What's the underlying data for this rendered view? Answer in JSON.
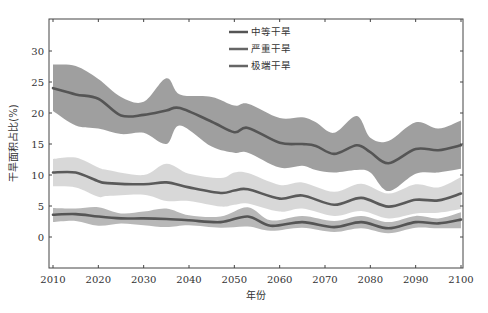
{
  "chart_data": {
    "type": "line",
    "title": "",
    "xlabel": "年份",
    "ylabel": "干旱面积占比(%)",
    "xlim": [
      2010,
      2100
    ],
    "ylim": [
      -5,
      35
    ],
    "x_ticks": [
      2010,
      2020,
      2030,
      2040,
      2050,
      2060,
      2070,
      2080,
      2090,
      2100
    ],
    "y_ticks": [
      0,
      5,
      10,
      15,
      20,
      25,
      30
    ],
    "grid": false,
    "legend_position": "upper center",
    "series": [
      {
        "name": "中等干旱",
        "line_color": "#555555",
        "band_color": "#9a9a9a",
        "x": [
          2010,
          2015,
          2020,
          2025,
          2030,
          2035,
          2038,
          2045,
          2050,
          2053,
          2060,
          2065,
          2068,
          2072,
          2077,
          2080,
          2084,
          2090,
          2095,
          2100
        ],
        "mean": [
          24.0,
          23.0,
          22.3,
          19.6,
          19.7,
          20.4,
          20.8,
          18.6,
          16.9,
          17.6,
          15.2,
          15.0,
          14.7,
          13.4,
          14.8,
          13.7,
          11.9,
          14.2,
          14.0,
          14.8
        ],
        "upper": [
          27.8,
          27.6,
          25.5,
          22.6,
          21.8,
          25.6,
          23.0,
          22.6,
          21.2,
          21.5,
          19.2,
          19.3,
          18.5,
          16.8,
          19.5,
          16.0,
          15.5,
          18.5,
          17.5,
          18.8
        ],
        "lower": [
          20.3,
          18.0,
          17.5,
          16.6,
          16.8,
          15.0,
          18.0,
          14.6,
          13.6,
          13.6,
          11.2,
          11.5,
          10.8,
          10.4,
          10.8,
          10.4,
          7.4,
          10.2,
          10.4,
          11.0
        ]
      },
      {
        "name": "严重干旱",
        "line_color": "#5a5a5a",
        "band_color": "#d6d6d6",
        "x": [
          2010,
          2015,
          2020,
          2022,
          2030,
          2035,
          2040,
          2047,
          2050,
          2053,
          2060,
          2065,
          2072,
          2078,
          2084,
          2090,
          2095,
          2100
        ],
        "mean": [
          10.4,
          10.4,
          9.0,
          8.7,
          8.5,
          8.8,
          8.0,
          7.1,
          7.5,
          7.7,
          6.2,
          6.7,
          5.2,
          6.3,
          4.9,
          6.0,
          5.9,
          7.0
        ],
        "upper": [
          12.6,
          12.8,
          11.2,
          10.8,
          10.0,
          11.8,
          10.2,
          9.5,
          10.4,
          10.3,
          8.4,
          8.8,
          7.3,
          8.6,
          7.0,
          8.5,
          8.0,
          9.7
        ],
        "lower": [
          8.2,
          8.0,
          6.5,
          6.6,
          6.8,
          5.8,
          5.8,
          4.9,
          5.2,
          5.4,
          4.1,
          4.6,
          3.4,
          4.2,
          3.0,
          3.8,
          3.9,
          4.5
        ]
      },
      {
        "name": "极端干旱",
        "line_color": "#555555",
        "band_color": "#b4b4b4",
        "x": [
          2010,
          2015,
          2020,
          2025,
          2030,
          2035,
          2040,
          2047,
          2053,
          2058,
          2065,
          2072,
          2078,
          2084,
          2090,
          2095,
          2100
        ],
        "mean": [
          3.6,
          3.7,
          3.3,
          3.0,
          3.0,
          2.9,
          2.7,
          2.4,
          3.3,
          1.8,
          2.4,
          1.6,
          2.4,
          1.4,
          2.4,
          2.2,
          2.8
        ],
        "upper": [
          4.7,
          4.6,
          4.8,
          3.8,
          4.1,
          4.6,
          3.5,
          3.3,
          4.8,
          2.7,
          3.4,
          2.6,
          3.4,
          2.4,
          3.4,
          3.0,
          4.0
        ],
        "lower": [
          2.4,
          2.6,
          1.8,
          2.2,
          1.9,
          1.6,
          1.9,
          1.5,
          1.7,
          1.0,
          1.5,
          0.8,
          1.4,
          0.6,
          1.5,
          1.4,
          1.4
        ]
      }
    ]
  },
  "legend": {
    "items": [
      {
        "label": "中等干旱",
        "color": "#555555"
      },
      {
        "label": "严重干旱",
        "color": "#666666"
      },
      {
        "label": "极端干旱",
        "color": "#666666"
      }
    ]
  },
  "axes": {
    "xlabel": "年份",
    "ylabel": "干旱面积占比(%)"
  }
}
